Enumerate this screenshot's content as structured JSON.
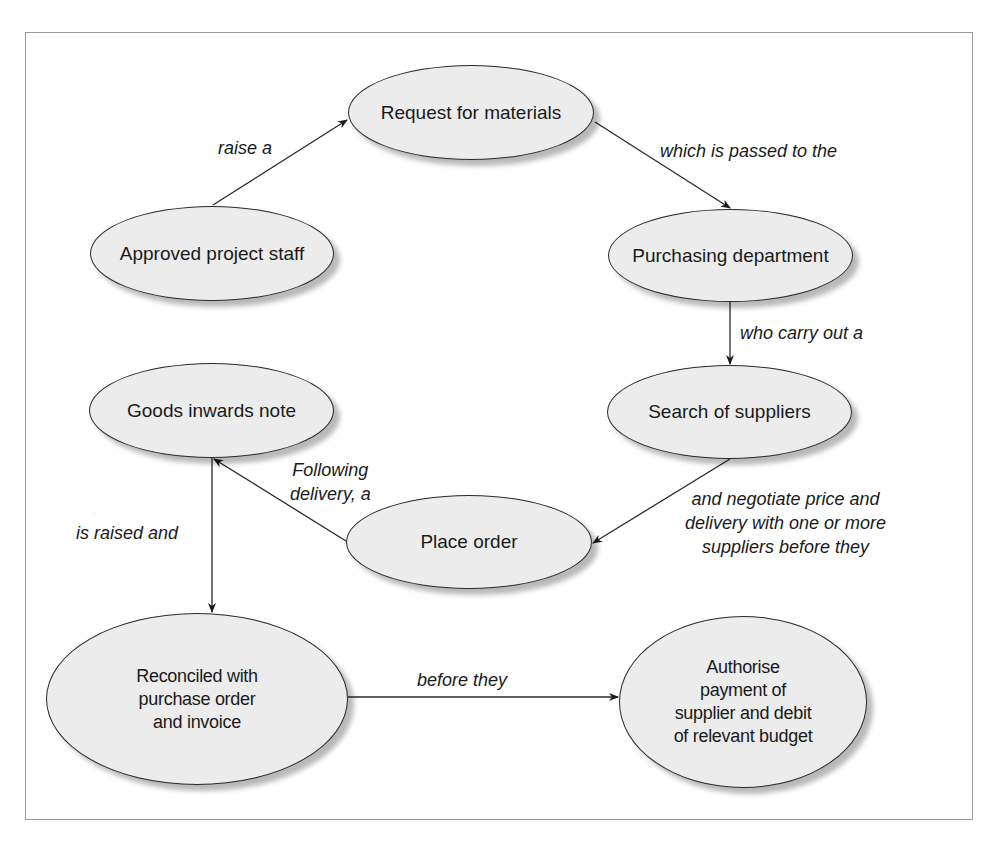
{
  "diagram": {
    "nodes": {
      "approved_staff": {
        "label": "Approved project staff"
      },
      "request": {
        "label": "Request for materials"
      },
      "purchasing": {
        "label": "Purchasing department"
      },
      "search": {
        "label": "Search of suppliers"
      },
      "goods_inwards": {
        "label": "Goods inwards note"
      },
      "place_order": {
        "label": "Place order"
      },
      "reconciled": {
        "lines": [
          "Reconciled with",
          "purchase order",
          "and invoice"
        ]
      },
      "authorise": {
        "lines": [
          "Authorise",
          "payment of",
          "supplier and debit",
          "of relevant budget"
        ]
      }
    },
    "edges": {
      "raise": {
        "label": "raise a"
      },
      "passed": {
        "label": "which is passed to the"
      },
      "carry_out": {
        "label": "who carry out a"
      },
      "negotiate": {
        "lines": [
          "and negotiate price and",
          "delivery with one or more",
          "suppliers before they"
        ]
      },
      "following": {
        "lines": [
          "Following",
          "delivery, a"
        ]
      },
      "raised_and": {
        "label": "is raised and"
      },
      "before_they": {
        "label": "before they"
      }
    },
    "colors": {
      "node_fill": "#ececec",
      "stroke": "#2a2a2a",
      "frame": "#9a9a9a"
    }
  }
}
